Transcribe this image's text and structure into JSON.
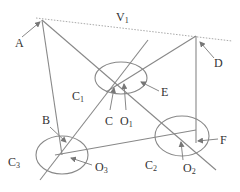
{
  "diagram": {
    "labels": {
      "A": "A",
      "B": "B",
      "C": "C",
      "D": "D",
      "E": "E",
      "F": "F",
      "V": "V",
      "V_sub": "1",
      "C1": "C",
      "C1_sub": "1",
      "C2": "C",
      "C2_sub": "2",
      "C3": "C",
      "C3_sub": "3",
      "O1": "O",
      "O1_sub": "1",
      "O2": "O",
      "O2_sub": "2",
      "O3": "O",
      "O3_sub": "3"
    },
    "colors": {
      "line": "#8a8a8a",
      "text": "#333333",
      "dotted": "#aaaaaa"
    }
  }
}
